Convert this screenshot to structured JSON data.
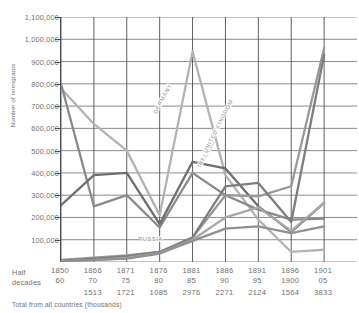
{
  "axis": {
    "y_title": "Number of immigrants",
    "y_ticks": [
      "1,100,000",
      "1,000,000",
      "900,000",
      "800,000",
      "700,000",
      "600,000",
      "500,000",
      "400,000",
      "300,000",
      "200,000",
      "100,000"
    ],
    "x_row1_label": "Half",
    "x_row2_label": "decades",
    "footnote": "Total from all countries (thousands)"
  },
  "columns": [
    {
      "start": "1850",
      "end": "60",
      "total": ""
    },
    {
      "start": "1866",
      "end": "70",
      "total": "1513"
    },
    {
      "start": "1871",
      "end": "75",
      "total": "1721"
    },
    {
      "start": "1876",
      "end": "80",
      "total": "1085"
    },
    {
      "start": "1881",
      "end": "85",
      "total": "2976"
    },
    {
      "start": "1886",
      "end": "90",
      "total": "2271"
    },
    {
      "start": "1891",
      "end": "95",
      "total": "2124"
    },
    {
      "start": "1896",
      "end": "1900",
      "total": "1564"
    },
    {
      "start": "1901",
      "end": "05",
      "total": "3833"
    }
  ],
  "series_labels": [
    {
      "name": "GERMANY",
      "x": 152,
      "y": 112,
      "angle": -62
    },
    {
      "name": "IRELAND",
      "x": 196,
      "y": 165,
      "angle": -60
    },
    {
      "name": "UNITED KINGDOM",
      "x": 202,
      "y": 151,
      "angle": -63
    },
    {
      "name": "RUSSIA",
      "x": 138,
      "y": 236,
      "angle": 0
    }
  ],
  "colors": {
    "grid": "#6f6f71",
    "axis": "#4d4d4f",
    "text": "#6f6f71",
    "label": "#8d8d8f",
    "germany": "#b3b3b3",
    "ireland": "#8a8a8c",
    "united_kingdom": "#6e6e70",
    "italy": "#989898",
    "austria_hungary": "#7d7d7f",
    "russia": "#a8a8a8",
    "scandinavia": "#909092"
  },
  "chart_data": {
    "type": "line",
    "title": "",
    "xlabel": "Half decades",
    "ylabel": "Number of immigrants",
    "ylim": [
      0,
      1100000
    ],
    "ytick_step": 100000,
    "grid": true,
    "legend": "inline-labels",
    "categories": [
      "1850-60",
      "1866-70",
      "1871-75",
      "1876-80",
      "1881-85",
      "1886-90",
      "1891-95",
      "1896-1900",
      "1901-05"
    ],
    "totals_thousands": [
      null,
      1513,
      1721,
      1085,
      2976,
      2271,
      2124,
      1564,
      3833
    ],
    "series": [
      {
        "name": "GERMANY",
        "color": "#b3b3b3",
        "values": [
          780000,
          620000,
          500000,
          210000,
          945000,
          390000,
          190000,
          45000,
          55000
        ]
      },
      {
        "name": "IRELAND",
        "color": "#8a8a8c",
        "values": [
          800000,
          250000,
          300000,
          155000,
          400000,
          300000,
          235000,
          190000,
          195000
        ]
      },
      {
        "name": "UNITED KINGDOM",
        "color": "#6e6e70",
        "values": [
          255000,
          390000,
          400000,
          170000,
          450000,
          420000,
          250000,
          135000,
          265000
        ]
      },
      {
        "name": "ITALY",
        "color": "#989898",
        "values": [
          9000,
          20000,
          30000,
          45000,
          110000,
          300000,
          295000,
          340000,
          960000
        ]
      },
      {
        "name": "AUSTRIA-HUNGARY",
        "color": "#7d7d7f",
        "values": [
          5000,
          15000,
          25000,
          45000,
          110000,
          340000,
          355000,
          180000,
          930000
        ]
      },
      {
        "name": "RUSSIA",
        "color": "#a8a8a8",
        "values": [
          3000,
          8000,
          18000,
          40000,
          100000,
          200000,
          245000,
          140000,
          265000
        ]
      },
      {
        "name": "SCANDINAVIA",
        "color": "#909092",
        "values": [
          2000,
          10000,
          15000,
          38000,
          95000,
          150000,
          160000,
          130000,
          160000
        ]
      }
    ]
  }
}
